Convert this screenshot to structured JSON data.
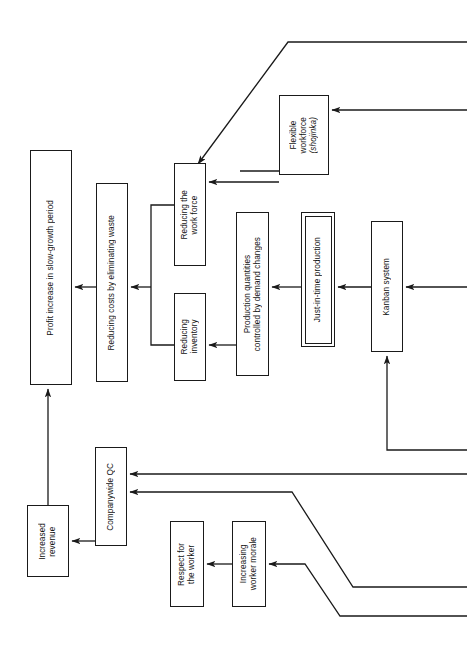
{
  "diagram": {
    "orientation": "rotated-90-ccw",
    "stroke_color": "#1a1a1a",
    "background_color": "#ffffff",
    "nodes": [
      {
        "id": "profit-increase",
        "label": "Profit increase in slow-growth period",
        "x": 30,
        "y": 150,
        "w": 42,
        "h": 235,
        "style": "single"
      },
      {
        "id": "reducing-costs",
        "label": "Reducing costs by eliminating waste",
        "x": 96,
        "y": 183,
        "w": 32,
        "h": 199,
        "style": "single"
      },
      {
        "id": "reducing-work-force",
        "label": "Reducing the\nwork force",
        "x": 174,
        "y": 163,
        "w": 32,
        "h": 103,
        "style": "single"
      },
      {
        "id": "reducing-inventory",
        "label": "Reducing\ninventory",
        "x": 174,
        "y": 293,
        "w": 32,
        "h": 88,
        "style": "single"
      },
      {
        "id": "production-quantities",
        "label": "Production quantities\ncontrolled by demand changes",
        "x": 236,
        "y": 212,
        "w": 33,
        "h": 164,
        "style": "single"
      },
      {
        "id": "flexible-workforce",
        "label": "Flexible\nworkforce\n(shojinka)",
        "x": 279,
        "y": 95,
        "w": 50,
        "h": 80,
        "style": "single",
        "italic_last_line": true
      },
      {
        "id": "just-in-time",
        "label": "Just-in-time production",
        "x": 301,
        "y": 212,
        "w": 34,
        "h": 135,
        "style": "double"
      },
      {
        "id": "kanban-system",
        "label": "Kanban system",
        "x": 371,
        "y": 221,
        "w": 32,
        "h": 131,
        "style": "single"
      },
      {
        "id": "increased-revenue",
        "label": "Increased\nrevenue",
        "x": 27,
        "y": 505,
        "w": 42,
        "h": 72,
        "style": "single"
      },
      {
        "id": "companywide-qc",
        "label": "Companywide QC",
        "x": 95,
        "y": 447,
        "w": 32,
        "h": 99,
        "style": "single"
      },
      {
        "id": "respect-worker",
        "label": "Respect for\nthe worker",
        "x": 170,
        "y": 521,
        "w": 34,
        "h": 86,
        "style": "single"
      },
      {
        "id": "increasing-morale",
        "label": "Increasing\nworker morale",
        "x": 232,
        "y": 521,
        "w": 34,
        "h": 86,
        "style": "single"
      }
    ],
    "connectors": [
      {
        "id": "reducing-costs-to-profit",
        "type": "arrow",
        "from": "reducing-costs",
        "to": "profit-increase"
      },
      {
        "id": "fork-to-reducing-costs",
        "type": "arrow",
        "from": "work-force-inventory-fork",
        "to": "reducing-costs"
      },
      {
        "id": "production-to-reducing-inventory",
        "type": "arrow",
        "from": "production-quantities",
        "to": "reducing-inventory"
      },
      {
        "id": "jit-to-production",
        "type": "arrow",
        "from": "just-in-time",
        "to": "production-quantities"
      },
      {
        "id": "kanban-to-jit",
        "type": "arrow",
        "from": "kanban-system",
        "to": "just-in-time"
      },
      {
        "id": "right-edge-to-kanban",
        "type": "arrow",
        "from": "off-page-right",
        "to": "kanban-system"
      },
      {
        "id": "flexible-to-work-force",
        "type": "arrow",
        "from": "flexible-workforce",
        "to": "reducing-work-force"
      },
      {
        "id": "top-diagonal-to-work-force",
        "type": "arrow",
        "from": "off-page-top-right",
        "to": "reducing-work-force"
      },
      {
        "id": "right-edge-to-flexible",
        "type": "arrow",
        "from": "off-page-right",
        "to": "flexible-workforce"
      },
      {
        "id": "flexible-down-to-jit-rail",
        "type": "line",
        "from": "flexible-workforce",
        "to": "left-rail"
      },
      {
        "id": "companywide-to-increased-revenue",
        "type": "arrow",
        "from": "companywide-qc",
        "to": "increased-revenue"
      },
      {
        "id": "increased-revenue-to-profit",
        "type": "arrow",
        "from": "increased-revenue",
        "to": "profit-increase"
      },
      {
        "id": "right-edge-to-companywide-1",
        "type": "arrow",
        "from": "off-page-right",
        "to": "companywide-qc"
      },
      {
        "id": "diagonal-to-companywide-2",
        "type": "arrow",
        "from": "off-page-bottom-right",
        "to": "companywide-qc"
      },
      {
        "id": "morale-to-respect",
        "type": "arrow",
        "from": "increasing-morale",
        "to": "respect-worker"
      },
      {
        "id": "diagonal-to-morale",
        "type": "arrow",
        "from": "off-page-bottom-right",
        "to": "increasing-morale"
      },
      {
        "id": "bottom-rail-to-kanban",
        "type": "arrow",
        "from": "bottom-rail",
        "to": "kanban-system"
      }
    ]
  }
}
